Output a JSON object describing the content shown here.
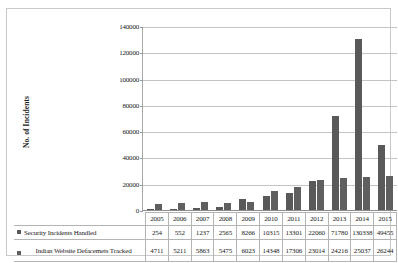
{
  "chart_data": {
    "type": "bar",
    "title": "",
    "subtitle": "",
    "xlabel": "",
    "ylabel": "No. of Incidents",
    "categories": [
      "2005",
      "2006",
      "2007",
      "2008",
      "2009",
      "2010",
      "2011",
      "2012",
      "2013",
      "2014",
      "2015"
    ],
    "series": [
      {
        "name": "Security Incidents Handled",
        "values": [
          254,
          552,
          1237,
          2565,
          8266,
          10315,
          13301,
          22060,
          71780,
          130338,
          49455
        ],
        "color": "#595959"
      },
      {
        "name": "Indian Website Defacemets Tracked",
        "values": [
          4711,
          5211,
          5863,
          5475,
          6023,
          14348,
          17306,
          23014,
          24216,
          25037,
          26244
        ],
        "color": "#5f5f5f"
      }
    ],
    "ylim": [
      0,
      140000
    ],
    "ytick_values": [
      0,
      20000,
      40000,
      60000,
      80000,
      100000,
      120000,
      140000
    ],
    "ytick_labels": [
      "0",
      "20000",
      "40000",
      "60000",
      "80000",
      "100000",
      "120000",
      "140000"
    ],
    "grid": true,
    "grid_axis": "y",
    "legend_position": "data-table-left",
    "data_table_visible": true
  },
  "icons": {
    "legend_marker": "filled-square-icon"
  }
}
